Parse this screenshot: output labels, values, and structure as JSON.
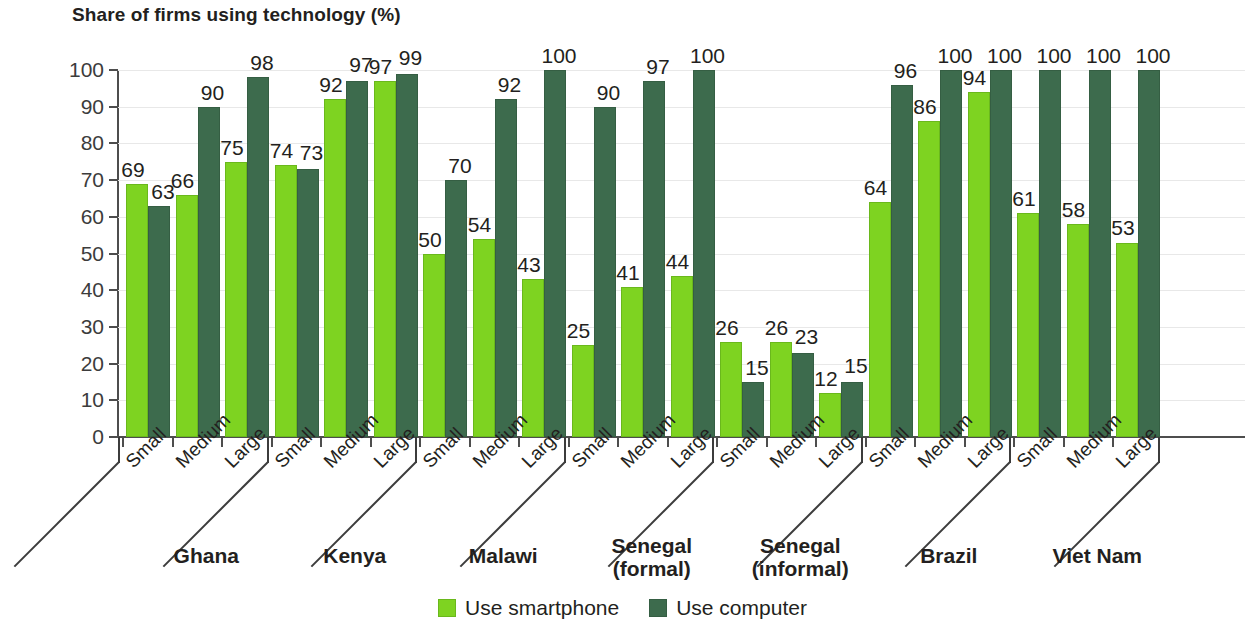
{
  "chart_data": {
    "type": "bar",
    "title": "Share of firms using technology (%)",
    "xlabel": "",
    "ylabel": "",
    "ylim": [
      0,
      100
    ],
    "yticks": [
      0,
      10,
      20,
      30,
      40,
      50,
      60,
      70,
      80,
      90,
      100
    ],
    "grid": true,
    "legend_position": "bottom-center",
    "categories": [
      "Small",
      "Medium",
      "Large",
      "Small",
      "Medium",
      "Large",
      "Small",
      "Medium",
      "Large",
      "Small",
      "Medium",
      "Large",
      "Small",
      "Medium",
      "Large",
      "Small",
      "Medium",
      "Large",
      "Small",
      "Medium",
      "Large"
    ],
    "groups": [
      {
        "name": "Ghana",
        "lines": [
          "Ghana"
        ]
      },
      {
        "name": "Kenya",
        "lines": [
          "Kenya"
        ]
      },
      {
        "name": "Malawi",
        "lines": [
          "Malawi"
        ]
      },
      {
        "name": "Senegal (formal)",
        "lines": [
          "Senegal",
          "(formal)"
        ]
      },
      {
        "name": "Senegal (informal)",
        "lines": [
          "Senegal",
          "(informal)"
        ]
      },
      {
        "name": "Brazil",
        "lines": [
          "Brazil"
        ]
      },
      {
        "name": "Viet Nam",
        "lines": [
          "Viet Nam"
        ]
      }
    ],
    "series": [
      {
        "name": "Use smartphone",
        "color": "#7ed321",
        "values": [
          69,
          66,
          75,
          74,
          92,
          97,
          50,
          54,
          43,
          25,
          41,
          44,
          26,
          26,
          12,
          64,
          86,
          94,
          61,
          58,
          53
        ]
      },
      {
        "name": "Use computer",
        "color": "#3d6b4d",
        "values": [
          63,
          90,
          98,
          73,
          97,
          99,
          70,
          92,
          100,
          90,
          97,
          100,
          15,
          23,
          15,
          96,
          100,
          100,
          100,
          100,
          100
        ]
      }
    ]
  },
  "legend": {
    "items": [
      {
        "label": "Use smartphone",
        "swatch": "light-green-square"
      },
      {
        "label": "Use computer",
        "swatch": "dark-green-square"
      }
    ]
  }
}
